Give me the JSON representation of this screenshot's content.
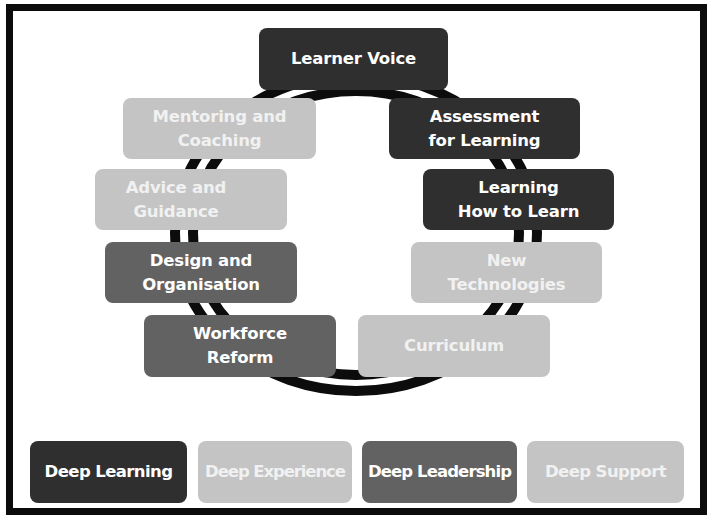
{
  "diagram": {
    "colors": {
      "dark": "#2f2f2f",
      "mid": "#626262",
      "light": "#c4c4c4",
      "ring": "#0c0c0c",
      "frame": "#0c0c0c",
      "background": "#ffffff"
    },
    "ring_nodes": [
      {
        "id": "learner-voice",
        "label": "Learner Voice",
        "shade": "dark"
      },
      {
        "id": "assessment-for-learning",
        "label": "Assessment\nfor Learning",
        "shade": "dark"
      },
      {
        "id": "learning-how-to-learn",
        "label": "Learning\nHow to Learn",
        "shade": "dark"
      },
      {
        "id": "new-technologies",
        "label": "New\nTechnologies",
        "shade": "light"
      },
      {
        "id": "curriculum",
        "label": "Curriculum",
        "shade": "light"
      },
      {
        "id": "workforce-reform",
        "label": "Workforce\nReform",
        "shade": "mid"
      },
      {
        "id": "design-and-organisation",
        "label": "Design and\nOrganisation",
        "shade": "mid"
      },
      {
        "id": "advice-and-guidance",
        "label": "Advice and\nGuidance",
        "shade": "light"
      },
      {
        "id": "mentoring-and-coaching",
        "label": "Mentoring and\nCoaching",
        "shade": "light"
      }
    ],
    "legend": [
      {
        "id": "deep-learning",
        "label": "Deep Learning",
        "shade": "dark"
      },
      {
        "id": "deep-experience",
        "label": "Deep Experience",
        "shade": "light"
      },
      {
        "id": "deep-leadership",
        "label": "Deep Leadership",
        "shade": "mid"
      },
      {
        "id": "deep-support",
        "label": "Deep Support",
        "shade": "light"
      }
    ]
  }
}
